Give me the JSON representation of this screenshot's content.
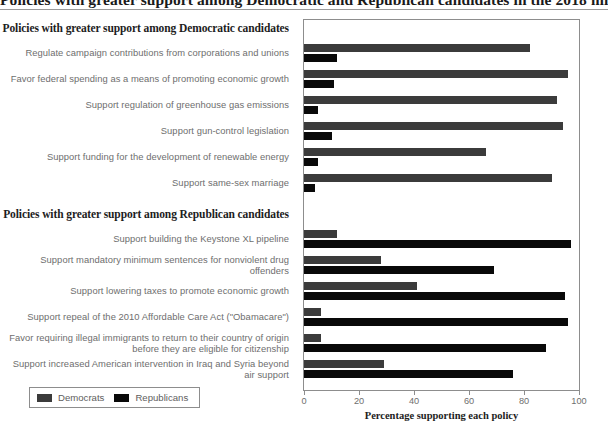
{
  "figure": {
    "cropped_title": "Policies with greater support among Democratic and Republican candidates in the 2018 midterm election",
    "section_democratic": "Policies with greater support among Democratic candidates",
    "section_republican": "Policies with greater support among Republican candidates"
  },
  "legend": {
    "democrats": "Democrats",
    "republicans": "Republicans",
    "democrats_color": "#3b3b3b",
    "republicans_color": "#090909"
  },
  "chart_data": {
    "type": "bar",
    "orientation": "horizontal",
    "title": "Policies with greater support among Democratic and Republican candidates",
    "xlabel": "Percentage supporting each policy",
    "ylabel": "",
    "xlim": [
      0,
      100
    ],
    "xticks": [
      0,
      20,
      40,
      60,
      80,
      100
    ],
    "xtick_labels": [
      "0",
      "20",
      "40",
      "60",
      "80",
      "100"
    ],
    "grid": false,
    "legend_position": "bottom-left",
    "sections": [
      {
        "header": "Policies with greater support among Democratic candidates",
        "categories": [
          "Regulate campaign contributions from corporations and unions",
          "Favor federal spending as a means of promoting economic growth",
          "Support regulation of greenhouse gas emissions",
          "Support gun-control legislation",
          "Support funding for the development of renewable energy",
          "Support same-sex marriage"
        ],
        "series": [
          {
            "name": "Democrats",
            "values": [
              82,
              96,
              92,
              94,
              66,
              90
            ]
          },
          {
            "name": "Republicans",
            "values": [
              12,
              11,
              5,
              10,
              5,
              4
            ]
          }
        ]
      },
      {
        "header": "Policies with greater support among Republican candidates",
        "categories": [
          "Support building the Keystone XL pipeline",
          "Support mandatory minimum sentences for nonviolent drug offenders",
          "Support lowering taxes to promote economic growth",
          "Support repeal of the 2010 Affordable Care Act (\"Obamacare\")",
          "Favor requiring illegal immigrants to return to their country of origin before they are eligible for citizenship",
          "Support increased American intervention in Iraq and Syria beyond air support"
        ],
        "series": [
          {
            "name": "Democrats",
            "values": [
              12,
              28,
              41,
              6,
              6,
              29
            ]
          },
          {
            "name": "Republicans",
            "values": [
              97,
              69,
              95,
              96,
              88,
              76
            ]
          }
        ]
      }
    ]
  },
  "labels": {
    "d1": "Regulate campaign contributions from corporations and unions",
    "d2": "Favor federal spending as a means of promoting economic growth",
    "d3": "Support regulation of greenhouse gas emissions",
    "d4": "Support gun-control legislation",
    "d5": "Support funding for the development of renewable energy",
    "d6": "Support same-sex marriage",
    "r1": "Support building the Keystone XL pipeline",
    "r2": "Support mandatory minimum sentences for nonviolent drug offenders",
    "r3": "Support lowering taxes to promote economic growth",
    "r4": "Support repeal of the 2010 Affordable Care Act (\"Obamacare\")",
    "r5": "Favor requiring illegal immigrants to return to their country of origin before they are eligible for citizenship",
    "r6": "Support increased American intervention in Iraq and Syria beyond air support"
  }
}
